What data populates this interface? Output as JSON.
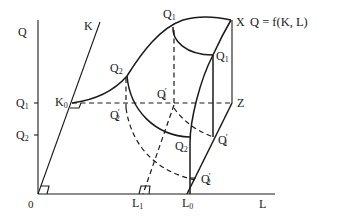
{
  "equation": "Q = f(K, L)",
  "axes": {
    "vertical_label": "Q",
    "horizontal_label": "L",
    "ray_label": "K",
    "origin_label": "0"
  },
  "ticks": {
    "q1": "Q",
    "q1_sub": "1",
    "q2": "Q",
    "q2_sub": "2",
    "l1": "L",
    "l1_sub": "1",
    "l0": "L",
    "l0_sub": "0"
  },
  "points": {
    "k0": "K",
    "k0_sub": "0",
    "x": "X",
    "z": "Z",
    "q1_top": "Q",
    "q1_top_sub": "1",
    "q1_right": "Q",
    "q1_right_sub": "1",
    "q2_top": "Q",
    "q2_top_sub": "2",
    "q2_lower": "Q",
    "q2_lower_sub": "2",
    "q1p_center": "Q",
    "q1p_center_sub": "1",
    "q2p_left": "Q",
    "q2p_left_sub": "2",
    "q1p_right": "Q",
    "q1p_right_sub": "1",
    "q2p_bottom": "Q",
    "q2p_bottom_sub": "2",
    "prime": "′"
  },
  "colors": {
    "ink": "#1a1a1a",
    "background": "#ffffff"
  }
}
